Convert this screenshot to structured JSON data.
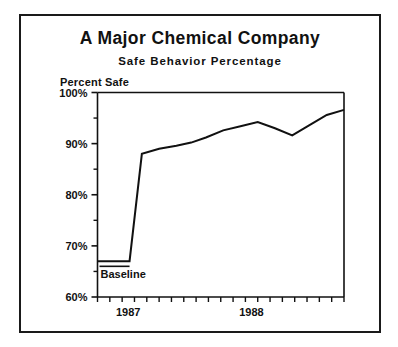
{
  "figure": {
    "title": "A Major Chemical Company",
    "subtitle": "Safe Behavior Percentage",
    "axis_title": "Percent Safe",
    "annotation": "Baseline",
    "frame_color": "#1a1a1a",
    "line_color": "#111111",
    "background": "#ffffff"
  },
  "chart_data": {
    "type": "line",
    "title": "A Major Chemical Company",
    "subtitle": "Safe Behavior Percentage",
    "xlabel": "",
    "ylabel": "Percent Safe",
    "ylim": [
      60,
      100
    ],
    "ytick_labels": [
      "100%",
      "90%",
      "80%",
      "70%",
      "60%"
    ],
    "ytick_values": [
      100,
      90,
      80,
      70,
      60
    ],
    "yminor_values": [
      95,
      85,
      75,
      65
    ],
    "xtick_labels": [
      "1987",
      "1988"
    ],
    "xtick_label_positions": [
      1.5,
      11.5
    ],
    "xlim": [
      0,
      20
    ],
    "x_minor_tick_count": 21,
    "grid": false,
    "legend": false,
    "annotations": [
      {
        "text": "Baseline",
        "x": 0.4,
        "y": 66.0,
        "note": "underlined flat pre-intervention phase"
      }
    ],
    "series": [
      {
        "name": "Safe Behavior Percentage",
        "x": [
          0.0,
          1.0,
          2.0,
          2.6,
          3.6,
          5.0,
          6.4,
          7.6,
          8.8,
          10.2,
          11.6,
          13.0,
          14.4,
          15.8,
          17.2,
          18.6,
          20.0
        ],
        "values": [
          67.0,
          67.0,
          67.0,
          67.0,
          88.0,
          89.0,
          89.6,
          90.2,
          91.2,
          92.6,
          93.4,
          94.2,
          93.0,
          91.6,
          93.6,
          95.6,
          96.6
        ]
      }
    ]
  }
}
